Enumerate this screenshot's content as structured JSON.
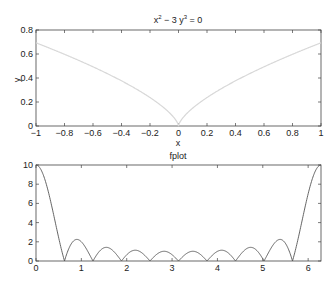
{
  "chart_data": [
    {
      "type": "line",
      "title": "x^2 - 3 y^3 = 0",
      "title_parts": {
        "base": "x",
        "sup1": "2",
        "mid": " − 3 y",
        "sup2": "3",
        "end": " = 0"
      },
      "xlabel": "x",
      "ylabel": "y",
      "xlim": [
        -1,
        1
      ],
      "ylim": [
        0,
        0.8
      ],
      "xticks": [
        "-1",
        "-0.8",
        "-0.6",
        "-0.4",
        "-0.2",
        "0",
        "0.2",
        "0.4",
        "0.6",
        "0.8",
        "1"
      ],
      "yticks": [
        "0",
        "0.2",
        "0.4",
        "0.6",
        "0.8"
      ],
      "grid": false,
      "series": [
        {
          "name": "implicit curve",
          "color": "#d8d8d8",
          "equation": "y = (x^2/3)^(1/3)",
          "x": [
            -1,
            -0.8,
            -0.6,
            -0.4,
            -0.2,
            0,
            0.2,
            0.4,
            0.6,
            0.8,
            1
          ],
          "y": [
            0.693,
            0.597,
            0.493,
            0.376,
            0.237,
            0,
            0.237,
            0.376,
            0.493,
            0.597,
            0.693
          ]
        }
      ]
    },
    {
      "type": "line",
      "title": "fplot",
      "xlabel": "",
      "ylabel": "",
      "xlim": [
        0,
        6.2832
      ],
      "ylim": [
        0,
        10
      ],
      "xticks": [
        "0",
        "1",
        "2",
        "3",
        "4",
        "5",
        "6"
      ],
      "yticks": [
        "0",
        "2",
        "4",
        "6",
        "8",
        "10"
      ],
      "grid": false,
      "series": [
        {
          "name": "|sin(5x)/sin(x/2)|",
          "color": "#555555",
          "x": [
            0,
            0.628,
            0.9,
            1.257,
            1.55,
            1.885,
            2.2,
            2.513,
            2.83,
            3.142,
            3.46,
            3.77,
            4.08,
            4.398,
            4.73,
            5.027,
            5.38,
            5.655,
            6.283
          ],
          "y": [
            10,
            0,
            2.25,
            0,
            1.45,
            0,
            1.15,
            0,
            1.03,
            0,
            1.03,
            0,
            1.15,
            0,
            1.45,
            0,
            2.25,
            0,
            10
          ]
        }
      ]
    }
  ]
}
